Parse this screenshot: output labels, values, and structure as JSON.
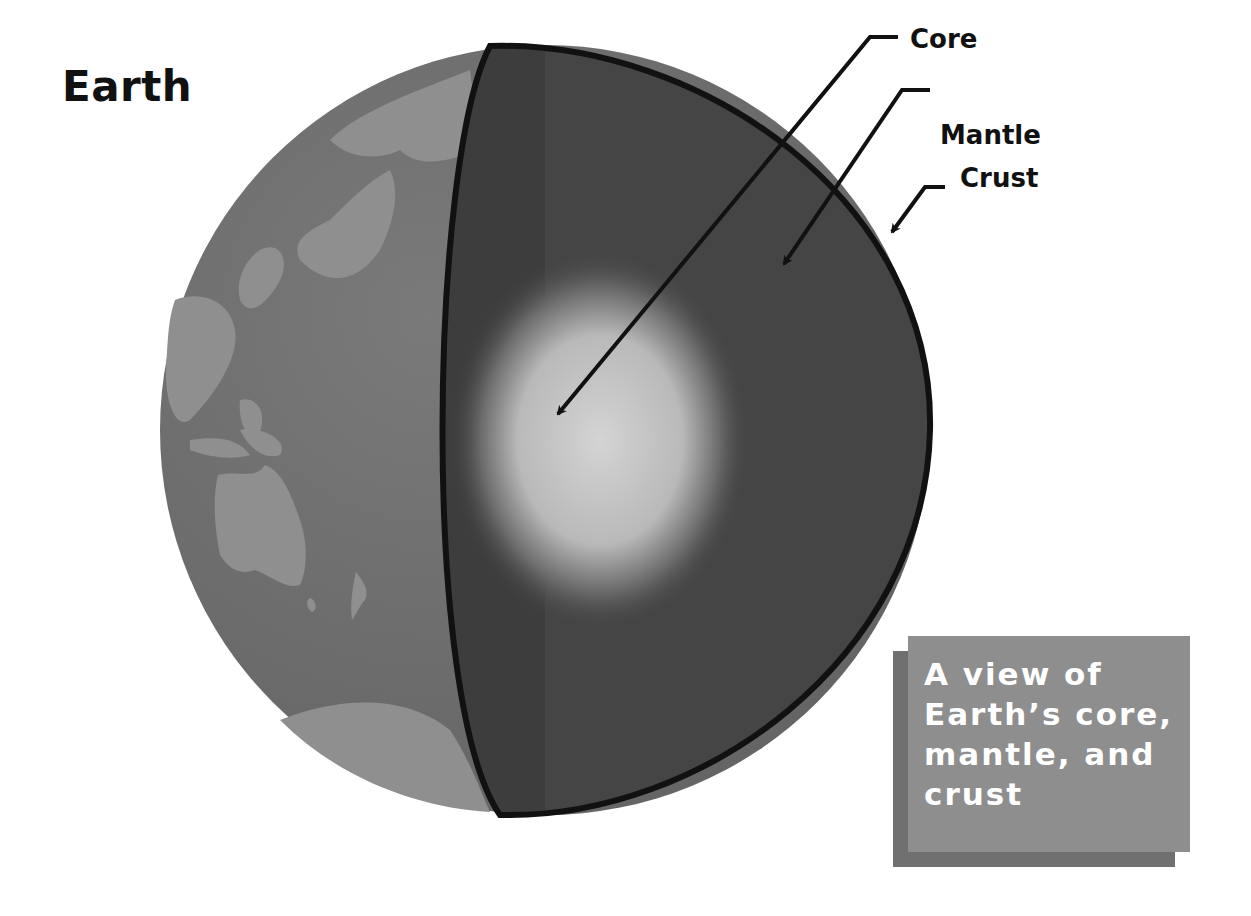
{
  "title": "Earth",
  "labels": {
    "core": "Core",
    "mantle": "Mantle",
    "crust": "Crust"
  },
  "caption": {
    "lines": [
      "A view of",
      "Earth’s core,",
      "mantle, and",
      "crust"
    ]
  },
  "colors": {
    "background": "#ffffff",
    "ocean": "#6e6e6e",
    "land": "#8f8f8f",
    "mantle": "#434343",
    "core_center": "#cfcfcf",
    "crust_outline": "#111111",
    "caption_box": "#8e8e8e",
    "caption_shadow": "#707070"
  }
}
